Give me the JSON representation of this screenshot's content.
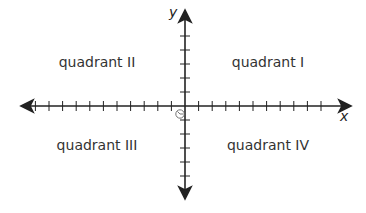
{
  "diagram": {
    "type": "coordinate-plane",
    "axes": {
      "x_label": "x",
      "y_label": "y",
      "color": "#222222",
      "x_ticks_left": 11,
      "x_ticks_right": 10,
      "y_ticks_above": 5,
      "y_ticks_below": 5
    },
    "origin_marker": "circle-with-mark",
    "quadrants": [
      {
        "id": "I",
        "label": "quadrant I"
      },
      {
        "id": "II",
        "label": "quadrant II"
      },
      {
        "id": "III",
        "label": "quadrant III"
      },
      {
        "id": "IV",
        "label": "quadrant IV"
      }
    ]
  }
}
